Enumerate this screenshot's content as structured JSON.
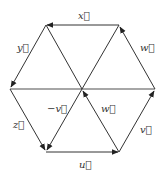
{
  "diagram": {
    "vertices": {
      "TL": [
        46,
        25
      ],
      "TR": [
        119,
        25
      ],
      "L": [
        10,
        89
      ],
      "C": [
        82,
        89
      ],
      "R": [
        155,
        89
      ],
      "BL": [
        46,
        152
      ],
      "BR": [
        119,
        152
      ]
    },
    "labels": {
      "x": "x⃗",
      "y": "y⃗",
      "w_outer": "w⃗",
      "z": "z⃗",
      "neg_v": "−v⃗",
      "w_inner": "w⃗",
      "v": "v⃗",
      "u": "u⃗"
    },
    "arrows": [
      {
        "name": "x",
        "from": "TR",
        "to": "TL"
      },
      {
        "name": "y",
        "from": "TL",
        "to": "L"
      },
      {
        "name": "w",
        "from": "R",
        "to": "TR"
      },
      {
        "name": "z",
        "from": "L",
        "to": "BL"
      },
      {
        "name": "-v",
        "from": "C",
        "to": "BL"
      },
      {
        "name": "u",
        "from": "BL",
        "to": "BR"
      },
      {
        "name": "v",
        "from": "BR",
        "to": "R"
      },
      {
        "name": "w",
        "from": "BR",
        "to": "C"
      }
    ],
    "colors": {
      "line": "#333333",
      "axis": "#888888"
    }
  }
}
